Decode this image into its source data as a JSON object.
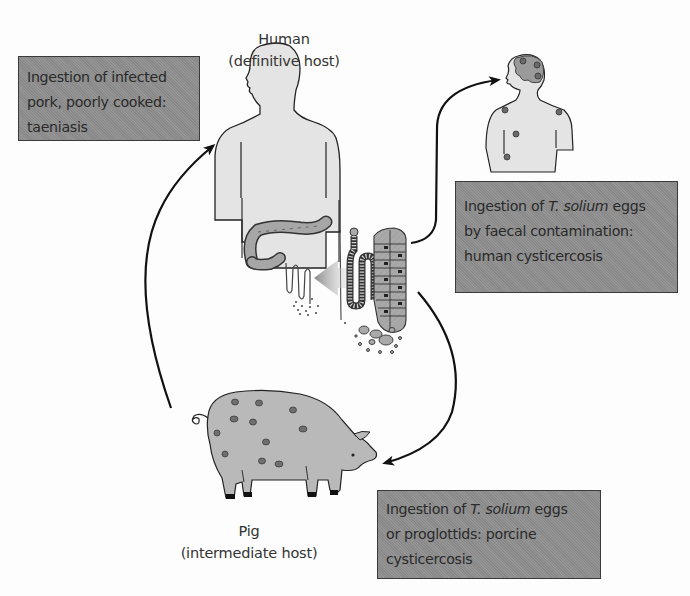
{
  "diagram": {
    "hosts": {
      "human": {
        "name": "Human",
        "role": "(definitive host)"
      },
      "pig": {
        "name": "Pig",
        "role": "(intermediate host)"
      }
    },
    "boxes": {
      "taeniasis": {
        "lines": [
          "Ingestion of infected",
          "pork, poorly cooked:",
          "taeniasis"
        ]
      },
      "human_cysticercosis": {
        "line1_pre": "Ingestion of ",
        "line1_italic": "T. solium",
        "line1_post": " eggs",
        "line2": "by faecal contamination:",
        "line3": "human cysticercosis"
      },
      "porcine_cysticercosis": {
        "line1_pre": "Ingestion of ",
        "line1_italic": "T. solium",
        "line1_post": " eggs",
        "line2": "or proglottids: porcine",
        "line3": "cysticercosis"
      }
    },
    "arrows": [
      {
        "from": "pig",
        "to": "human",
        "label_ref": "taeniasis"
      },
      {
        "from": "tapeworm",
        "to": "human-cysticercosis",
        "label_ref": "human_cysticercosis"
      },
      {
        "from": "eggs",
        "to": "pig",
        "label_ref": "porcine_cysticercosis"
      },
      {
        "from": "tapeworm",
        "to": "intestine",
        "style": "gray-block-arrow"
      }
    ],
    "colors": {
      "box_fill": "#8e8e8e",
      "body_fill": "#e3e3e3",
      "outline": "#222222",
      "cyst_dot": "#6a6a6a",
      "pig_fill": "#b8b8b8"
    }
  }
}
